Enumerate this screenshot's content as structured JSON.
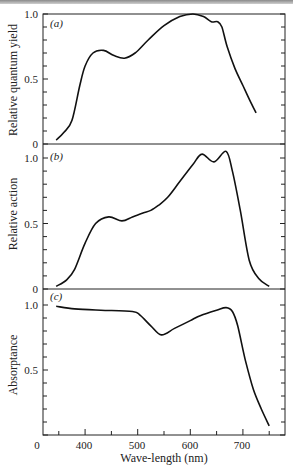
{
  "chart_data": [
    {
      "type": "line",
      "panel_label": "(a)",
      "ylabel": "Relative quantum yield",
      "xlabel": "Wave-length (nm)",
      "xlim": [
        320,
        780
      ],
      "ylim": [
        0,
        1.0
      ],
      "yticks": [
        "0",
        "0.5",
        "1.0"
      ],
      "x": [
        345,
        360,
        375,
        390,
        400,
        415,
        435,
        455,
        475,
        495,
        520,
        550,
        580,
        605,
        625,
        640,
        652,
        660,
        670,
        685,
        700,
        715,
        725
      ],
      "values": [
        0.03,
        0.09,
        0.18,
        0.45,
        0.6,
        0.7,
        0.72,
        0.68,
        0.66,
        0.7,
        0.8,
        0.91,
        0.98,
        1.0,
        0.98,
        0.94,
        0.94,
        0.9,
        0.75,
        0.58,
        0.45,
        0.32,
        0.24
      ]
    },
    {
      "type": "line",
      "panel_label": "(b)",
      "ylabel": "Relative action",
      "xlabel": "Wave-length (nm)",
      "xlim": [
        320,
        780
      ],
      "ylim": [
        0,
        1.0
      ],
      "yticks": [
        "0",
        "0.5",
        "1.0"
      ],
      "x": [
        345,
        365,
        380,
        400,
        420,
        445,
        470,
        490,
        510,
        525,
        540,
        557,
        580,
        605,
        622,
        645,
        668,
        680,
        695,
        712,
        730,
        750
      ],
      "values": [
        0.02,
        0.07,
        0.15,
        0.35,
        0.5,
        0.55,
        0.52,
        0.55,
        0.58,
        0.6,
        0.64,
        0.7,
        0.82,
        0.95,
        1.03,
        0.97,
        1.05,
        0.9,
        0.6,
        0.22,
        0.08,
        0.02
      ]
    },
    {
      "type": "line",
      "panel_label": "(c)",
      "ylabel": "Absorptance",
      "xlabel": "Wave-length (nm)",
      "xlim": [
        320,
        780
      ],
      "ylim": [
        0,
        1.0
      ],
      "yticks": [
        "0",
        "0.5",
        "1.0"
      ],
      "x": [
        345,
        380,
        430,
        490,
        505,
        525,
        545,
        570,
        600,
        620,
        650,
        668,
        680,
        690,
        705,
        720,
        735,
        750
      ],
      "values": [
        0.99,
        0.97,
        0.96,
        0.95,
        0.92,
        0.84,
        0.77,
        0.82,
        0.88,
        0.92,
        0.96,
        0.98,
        0.95,
        0.84,
        0.57,
        0.35,
        0.2,
        0.07
      ]
    }
  ],
  "x_axis": {
    "title": "Wave-length (nm)",
    "tick_labels": [
      "0",
      "400",
      "500",
      "600",
      "700"
    ],
    "major_ticks": [
      400,
      500,
      600,
      700
    ],
    "minor_ticks": [
      350,
      450,
      550,
      650,
      750
    ]
  },
  "panels": [
    {
      "tag": "(a)",
      "ylabel": "Relative quantum yield",
      "ytick_top": "1.0",
      "ytick_mid": "0.5",
      "ytick_bottom": "0"
    },
    {
      "tag": "(b)",
      "ylabel": "Relative action",
      "ytick_top": "1.0",
      "ytick_mid": "0.5",
      "ytick_bottom": "0"
    },
    {
      "tag": "(c)",
      "ylabel": "Absorptance",
      "ytick_top": "1.0",
      "ytick_mid": "0.5",
      "ytick_bottom": "0"
    }
  ],
  "caption_fragment": "                                                                  "
}
